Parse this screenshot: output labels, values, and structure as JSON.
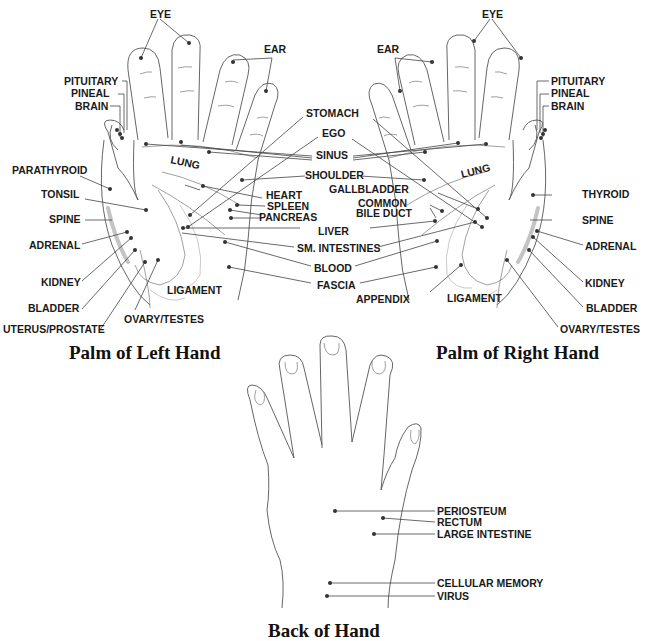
{
  "diagram": {
    "type": "hand reflexology chart",
    "captions": {
      "left_palm": "Palm of Left Hand",
      "right_palm": "Palm of Right Hand",
      "back": "Back of Hand"
    },
    "left_palm": {
      "labels": {
        "eye": "EYE",
        "ear": "EAR",
        "pituitary": "PITUITARY",
        "pineal": "PINEAL",
        "brain": "BRAIN",
        "parathyroid": "PARATHYROID",
        "tonsil": "TONSIL",
        "spine": "SPINE",
        "adrenal": "ADRENAL",
        "kidney": "KIDNEY",
        "bladder": "BLADDER",
        "uterus_prostate": "UTERUS/PROSTATE",
        "ovary_testes": "OVARY/TESTES",
        "ligament": "LIGAMENT",
        "lung": "LUNG",
        "heart": "HEART",
        "spleen": "SPLEEN",
        "pancreas": "PANCREAS"
      }
    },
    "center": {
      "labels": {
        "stomach": "STOMACH",
        "ego": "EGO",
        "sinus": "SINUS",
        "shoulder": "SHOULDER",
        "liver": "LIVER",
        "sm_intestines": "SM. INTESTINES",
        "blood": "BLOOD",
        "fascia": "FASCIA"
      }
    },
    "right_palm": {
      "labels": {
        "eye": "EYE",
        "ear": "EAR",
        "pituitary": "PITUITARY",
        "pineal": "PINEAL",
        "brain": "BRAIN",
        "lung": "LUNG",
        "gallbladder": "GALLBLADDER",
        "common_bile_duct_1": "COMMON",
        "common_bile_duct_2": "BILE DUCT",
        "thyroid": "THYROID",
        "spine": "SPINE",
        "adrenal": "ADRENAL",
        "kidney": "KIDNEY",
        "bladder": "BLADDER",
        "ovary_testes": "OVARY/TESTES",
        "ligament": "LIGAMENT",
        "appendix": "APPENDIX"
      }
    },
    "back_of_hand": {
      "labels": {
        "periosteum": "PERIOSTEUM",
        "rectum": "RECTUM",
        "large_intestine": "LARGE INTESTINE",
        "cellular_memory": "CELLULAR MEMORY",
        "virus": "VIRUS"
      }
    }
  }
}
